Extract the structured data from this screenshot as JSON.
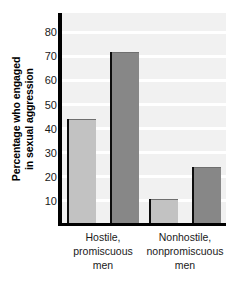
{
  "chart_data": {
    "type": "bar",
    "title": "",
    "subtitle": "",
    "xlabel": "",
    "ylabel_line1": "Percentage who engaged",
    "ylabel_line2": "in sexual aggression",
    "ylabel": "Percentage who engaged in sexual aggression",
    "categories": [
      "Hostile, promiscuous men",
      "Nonhostile, nonpromiscuous men"
    ],
    "category_lines": [
      [
        "Hostile,",
        "promiscuous",
        "men"
      ],
      [
        "Nonhostile,",
        "nonpromiscuous",
        "men"
      ]
    ],
    "series": [
      {
        "name": "light-bar",
        "color": "#c2c2c2",
        "values": [
          44,
          11
        ]
      },
      {
        "name": "dark-bar",
        "color": "#878787",
        "values": [
          72,
          24
        ]
      }
    ],
    "ylim": [
      0,
      88
    ],
    "yticks": [
      10,
      20,
      30,
      40,
      50,
      60,
      70,
      80
    ],
    "ytick_labels": [
      "10",
      "20",
      "30",
      "40",
      "50",
      "60",
      "70",
      "80"
    ],
    "grid": true,
    "grid_color": "#ffffff",
    "plot_background": "#f1f1f1",
    "axis_color": "#000000",
    "legend": "none"
  }
}
